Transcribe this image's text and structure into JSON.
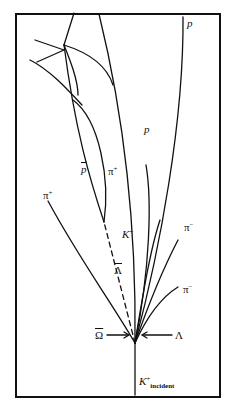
{
  "diagram": {
    "title": "",
    "labels": {
      "p_top": "p",
      "p_mid": "p",
      "pbar": "p",
      "pbar_mark": "¯",
      "pi_plus_upper": "π",
      "pi_plus_upper_sup": "+",
      "pi_plus_left": "π",
      "pi_plus_left_sup": "+",
      "k_plus": "K",
      "k_plus_sup": "+",
      "pi_minus_upper": "π",
      "pi_minus_upper_sup": "−",
      "pi_minus_lower": "π",
      "pi_minus_lower_sup": "−",
      "lambda_bar": "Λ",
      "omega_bar": "Ω",
      "lambda": "Λ",
      "k_incident": "K",
      "k_incident_sup": "+",
      "k_incident_sub": "incident"
    },
    "colors": {
      "ink": "#111111",
      "background": "#ffffff"
    }
  }
}
